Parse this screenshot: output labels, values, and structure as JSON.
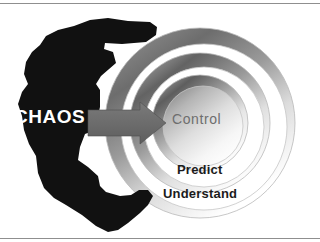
{
  "figure": {
    "title_text": "",
    "background_color": "#ffffff",
    "width": 320,
    "height": 242
  },
  "labels": {
    "chaos": "CHAOS",
    "control": "Control",
    "predict": "Predict",
    "understand": "Understand"
  },
  "shapes": {
    "blob": {
      "name": "chaos-blob",
      "color": "#111111"
    },
    "arrow": {
      "name": "transition-arrow",
      "color": "#6b6b6b",
      "direction": "right"
    },
    "rings": [
      {
        "name": "outer-ring",
        "label": "Understand",
        "radius": 95
      },
      {
        "name": "middle-ring",
        "label": "Predict",
        "radius": 70
      },
      {
        "name": "inner-ring",
        "label": "Control",
        "radius": 48
      }
    ]
  },
  "colors": {
    "text_light": "#ffffff",
    "text_dark": "#1b1b1b",
    "text_muted": "#6e6e6e",
    "arrow": "#6b6b6b",
    "blob": "#111111",
    "ring_dark": "#5a5a5a",
    "ring_light": "#ffffff",
    "rule": "#8f8f8f"
  }
}
